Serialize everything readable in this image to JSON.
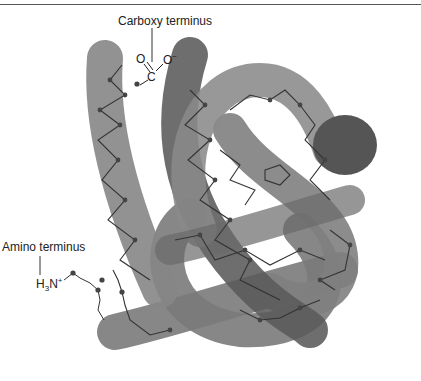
{
  "figure": {
    "labels": {
      "carboxy": "Carboxy terminus",
      "amino": "Amino terminus"
    },
    "chem": {
      "carboxyl_o1": "O",
      "carboxyl_o2": "O",
      "carboxyl_o2_charge": "−",
      "carboxyl_c": "C",
      "amine_h": "H",
      "amine_sub": "3",
      "amine_n": "N",
      "amine_charge": "+"
    },
    "colors": {
      "tube_light": "#8a8a8a",
      "tube_dark": "#5a5a5a",
      "chain": "#333333",
      "residue": "#444444"
    }
  }
}
